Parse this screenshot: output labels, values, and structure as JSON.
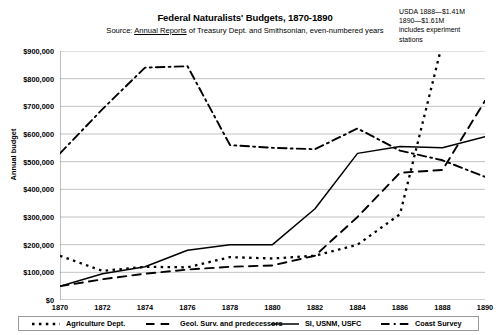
{
  "header": {
    "title": "Federal Naturalists' Budgets, 1870-1890",
    "subtitle_prefix": "Source: ",
    "subtitle_source": "Annual Reports",
    "subtitle_suffix": " of Treasury Dept. and Smithsonian, even-numbered years",
    "annotation": [
      "USDA 1888—$1.41M",
      "1890—$1.61M",
      "includes experiment",
      "stations"
    ]
  },
  "chart_data": {
    "type": "line",
    "title": "Federal Naturalists' Budgets, 1870-1890",
    "subtitle": "Source: Annual Reports of Treasury Dept. and Smithsonian, even-numbered years",
    "annotation": "USDA 1888—$1.41M 1890—$1.61M includes experiment stations",
    "xlabel": "",
    "ylabel": "Annual budget",
    "x": [
      1870,
      1872,
      1874,
      1876,
      1878,
      1880,
      1882,
      1884,
      1886,
      1888,
      1890
    ],
    "xtick_labels": [
      "1870",
      "1872",
      "1874",
      "1876",
      "1878",
      "1880",
      "1882",
      "1884",
      "1886",
      "1888",
      "1890"
    ],
    "ylim": [
      0,
      900000
    ],
    "ytick_values": [
      0,
      100000,
      200000,
      300000,
      400000,
      500000,
      600000,
      700000,
      800000,
      900000
    ],
    "ytick_labels": [
      "$0",
      "$100,000",
      "$200,000",
      "$300,000",
      "$400,000",
      "$500,000",
      "$600,000",
      "$700,000",
      "$800,000",
      "$900,000"
    ],
    "grid": true,
    "grid_axis": "y",
    "legend_position": "bottom",
    "series": [
      {
        "name": "Agriculture Dept.",
        "style": "dotted",
        "color": "#000000",
        "values": [
          160000,
          105000,
          120000,
          118000,
          155000,
          150000,
          160000,
          200000,
          310000,
          930000,
          null
        ],
        "clipped_above_axis": true
      },
      {
        "name": "Geol. Surv. and predecessors",
        "style": "dashed",
        "color": "#000000",
        "values": [
          50000,
          75000,
          95000,
          110000,
          120000,
          125000,
          160000,
          300000,
          460000,
          470000,
          720000
        ]
      },
      {
        "name": "SI, USNM, USFC",
        "style": "solid",
        "color": "#000000",
        "values": [
          50000,
          95000,
          120000,
          180000,
          200000,
          200000,
          330000,
          530000,
          555000,
          550000,
          590000
        ]
      },
      {
        "name": "Coast Survey",
        "style": "dash-dot",
        "color": "#000000",
        "values": [
          530000,
          690000,
          840000,
          845000,
          560000,
          550000,
          545000,
          620000,
          540000,
          505000,
          445000
        ]
      }
    ]
  },
  "legend": {
    "items": [
      {
        "label": "Agriculture Dept.",
        "style": "dotted"
      },
      {
        "label": "Geol. Surv. and predecessors",
        "style": "dashed"
      },
      {
        "label": "SI, USNM, USFC",
        "style": "solid"
      },
      {
        "label": "Coast Survey",
        "style": "dash-dot"
      }
    ]
  },
  "style": {
    "grid_color": "#b3b3b3",
    "axis_color": "#808080",
    "line_color": "#000000",
    "background": "#ffffff"
  }
}
